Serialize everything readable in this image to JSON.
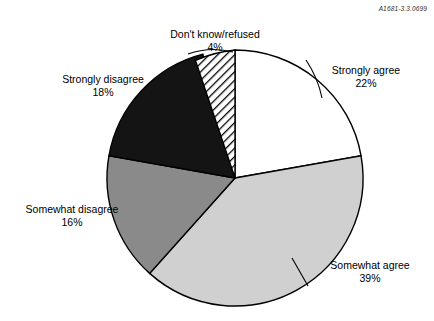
{
  "document_id": "A1681-3.3.0699",
  "chart_data": {
    "type": "pie",
    "title": "",
    "subtitle": "",
    "xlabel": "",
    "ylabel": "",
    "legend_position": "none",
    "grid": false,
    "start_angle_deg": 0,
    "direction": "clockwise",
    "center": {
      "x": 235,
      "y": 178
    },
    "radius": 128,
    "units": "percent",
    "categories": [
      "Strongly agree",
      "Somewhat agree",
      "Somewhat disagree",
      "Strongly disagree",
      "Don't know/refused"
    ],
    "values": [
      22,
      39,
      16,
      18,
      4
    ],
    "slices": [
      {
        "label": "Strongly agree",
        "value": 22,
        "value_text": "22%",
        "fill": "#ffffff",
        "pattern": "solid",
        "stroke": "#000000"
      },
      {
        "label": "Somewhat agree",
        "value": 39,
        "value_text": "39%",
        "fill": "#d0d0d0",
        "pattern": "solid",
        "stroke": "#000000"
      },
      {
        "label": "Somewhat disagree",
        "value": 16,
        "value_text": "16%",
        "fill": "#8a8a8a",
        "pattern": "solid",
        "stroke": "#000000"
      },
      {
        "label": "Strongly disagree",
        "value": 18,
        "value_text": "18%",
        "fill": "#141414",
        "pattern": "solid",
        "stroke": "#000000"
      },
      {
        "label": "Don't know/refused",
        "value": 4,
        "value_text": "4%",
        "fill": "#ffffff",
        "pattern": "diagonal-hatch",
        "stroke": "#000000"
      }
    ]
  },
  "labels": {
    "dont_know": {
      "name": "Don't know/refused",
      "pct": "4%"
    },
    "strongly_agree": {
      "name": "Strongly agree",
      "pct": "22%"
    },
    "somewhat_agree": {
      "name": "Somewhat agree",
      "pct": "39%"
    },
    "somewhat_disagree": {
      "name": "Somewhat disagree",
      "pct": "16%"
    },
    "strongly_disagree": {
      "name": "Strongly disagree",
      "pct": "18%"
    }
  },
  "colors": {
    "background": "#ffffff",
    "outline": "#000000",
    "light_gray": "#d0d0d0",
    "mid_gray": "#8a8a8a",
    "near_black": "#141414"
  }
}
